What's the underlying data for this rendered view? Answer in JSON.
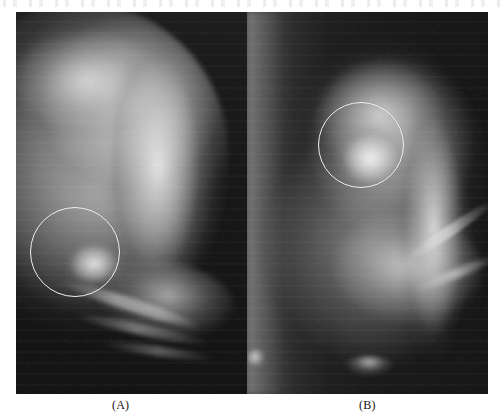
{
  "figure": {
    "type": "mammogram-comparison",
    "panel_count": 2,
    "background_color": "#ffffff",
    "annotation_color": "#f2f2f2"
  },
  "captions": {
    "panel_a": "(A)",
    "panel_b": "(B)"
  },
  "panels": [
    {
      "id": "panel-a",
      "label": "(A)",
      "modality": "mammography",
      "background_color": "#181818",
      "annotation": {
        "shape": "circle",
        "color": "#f2f2f2",
        "center_x": 75,
        "center_y": 256,
        "radius": 45
      }
    },
    {
      "id": "panel-b",
      "label": "(B)",
      "modality": "mammography",
      "background_color": "#1f1f1f",
      "annotation": {
        "shape": "circle",
        "color": "#f2f2f2",
        "center_x": 362,
        "center_y": 145,
        "radius": 43
      }
    }
  ]
}
